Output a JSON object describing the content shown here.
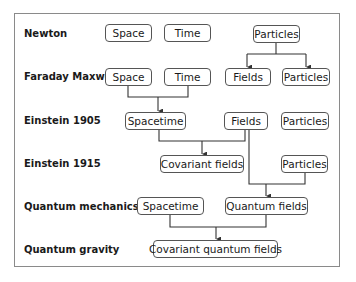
{
  "diagram": {
    "rows": [
      {
        "label": "Newton",
        "y": 27
      },
      {
        "label": "Faraday Maxwell",
        "y": 71
      },
      {
        "label": "Einstein 1905",
        "y": 115
      },
      {
        "label": "Einstein 1915",
        "y": 158
      },
      {
        "label": "Quantum mechanics",
        "y": 200
      },
      {
        "label": "Quantum gravity",
        "y": 243
      }
    ],
    "nodes": {
      "newton_space": "Space",
      "newton_time": "Time",
      "newton_particles": "Particles",
      "fm_space": "Space",
      "fm_time": "Time",
      "fm_fields": "Fields",
      "fm_particles": "Particles",
      "e1905_spacetime": "Spacetime",
      "e1905_fields": "Fields",
      "e1905_particles": "Particles",
      "e1915_covariant_fields": "Covariant fields",
      "e1915_particles": "Particles",
      "qm_spacetime": "Spacetime",
      "qm_quantum_fields": "Quantum fields",
      "qg_covariant_quantum_fields": "Covariant quantum fields"
    },
    "colors": {
      "line": "#333333",
      "border": "#555555",
      "frame": "#8a8a8a"
    }
  }
}
